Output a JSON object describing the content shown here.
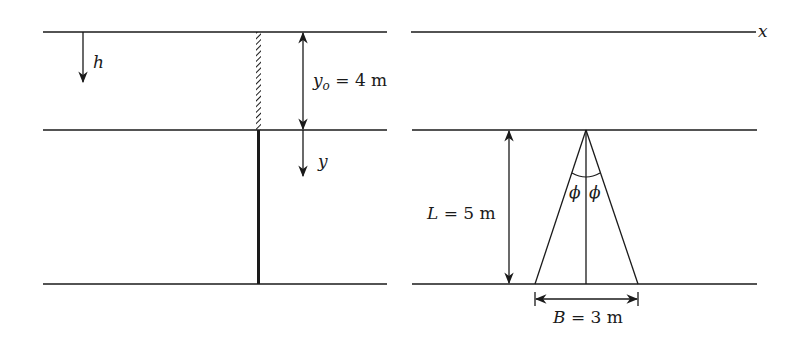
{
  "left_panel": {
    "h_label": "h",
    "yo_label_var": "y",
    "yo_label_sub": "o",
    "yo_label_value": " = 4 m",
    "y_label": "y"
  },
  "right_panel": {
    "x_label": "x",
    "L_label_var": "L",
    "L_label_value": " = 5 m",
    "phi_left": "ϕ",
    "phi_right": "ϕ",
    "B_label_var": "B",
    "B_label_value": " = 3 m"
  },
  "colors": {
    "line": "#1a1a1a",
    "background": "#ffffff"
  }
}
